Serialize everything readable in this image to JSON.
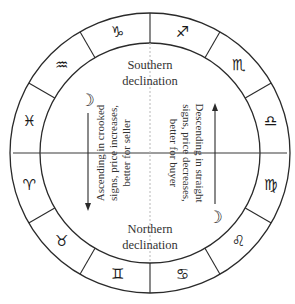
{
  "diagram": {
    "center": {
      "x": 150,
      "y": 153
    },
    "outer_radius": 140,
    "inner_radius": 110,
    "zodiac": [
      {
        "name": "capricorn",
        "glyph": "♑",
        "angle": 105
      },
      {
        "name": "sagittarius",
        "glyph": "♐",
        "angle": 75
      },
      {
        "name": "scorpio",
        "glyph": "♏",
        "angle": 45
      },
      {
        "name": "libra",
        "glyph": "♎",
        "angle": 15
      },
      {
        "name": "virgo",
        "glyph": "♍",
        "angle": -15
      },
      {
        "name": "leo",
        "glyph": "♌",
        "angle": -45
      },
      {
        "name": "cancer",
        "glyph": "♋",
        "angle": -75
      },
      {
        "name": "gemini",
        "glyph": "♊",
        "angle": -105
      },
      {
        "name": "taurus",
        "glyph": "♉",
        "angle": -135
      },
      {
        "name": "aries",
        "glyph": "♈",
        "angle": -165
      },
      {
        "name": "pisces",
        "glyph": "♓",
        "angle": 165
      },
      {
        "name": "aquarius",
        "glyph": "♒",
        "angle": 135
      }
    ],
    "southern": {
      "line1": "Southern",
      "line2": "declination"
    },
    "northern": {
      "line1": "Northern",
      "line2": "declination"
    },
    "left_text": {
      "line1": "Ascending in crooked",
      "line2": "signs, price increases,",
      "line3": "better for seller",
      "moon_glyph": "☽",
      "arrow_direction": "down"
    },
    "right_text": {
      "line1": "Descending in straight",
      "line2": "signs, price decreases,",
      "line3": "better for buyer",
      "moon_glyph": "☽",
      "arrow_direction": "up"
    },
    "colors": {
      "stroke": "#2a2a2a",
      "text": "#333333",
      "dotted_axis": "#b8b8b8"
    }
  }
}
